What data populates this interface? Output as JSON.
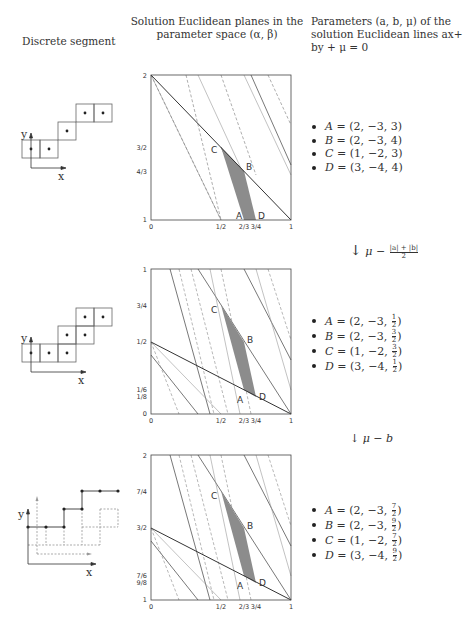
{
  "headers": {
    "col1": "Discrete segment",
    "col2_line1": "Solution Euclidean planes in the",
    "col2_line2": "parameter space (α, β)",
    "col3_line1": "Parameters (a, b, μ) of the",
    "col3_line2": "solution Euclidean lines ax+",
    "col3_line3": "by + μ = 0"
  },
  "rows": [
    {
      "segment": {
        "axis_x": "x",
        "axis_y": "y",
        "style": "pixels"
      },
      "params": [
        {
          "name": "A",
          "a": "2",
          "b": "−3",
          "mu": "3"
        },
        {
          "name": "B",
          "a": "2",
          "b": "−3",
          "mu": "4"
        },
        {
          "name": "C",
          "a": "1",
          "b": "−2",
          "mu": "3"
        },
        {
          "name": "D",
          "a": "3",
          "b": "−4",
          "mu": "4"
        }
      ],
      "transform": {
        "arrow": "↓",
        "text": "μ −",
        "frac_num": "|a| + |b|",
        "frac_den": "2"
      }
    },
    {
      "segment": {
        "axis_x": "x",
        "axis_y": "y",
        "style": "pixels"
      },
      "params": [
        {
          "name": "A",
          "a": "2",
          "b": "−3",
          "mu_num": "1",
          "mu_den": "2"
        },
        {
          "name": "B",
          "a": "2",
          "b": "−3",
          "mu_num": "3",
          "mu_den": "2"
        },
        {
          "name": "C",
          "a": "1",
          "b": "−2",
          "mu_num": "3",
          "mu_den": "2"
        },
        {
          "name": "D",
          "a": "3",
          "b": "−4",
          "mu_num": "1",
          "mu_den": "2"
        }
      ],
      "transform": {
        "arrow": "↓",
        "text": "μ − b"
      }
    },
    {
      "segment": {
        "axis_x": "x",
        "axis_y": "y",
        "style": "points"
      },
      "params": [
        {
          "name": "A",
          "a": "2",
          "b": "−3",
          "mu_num": "7",
          "mu_den": "2"
        },
        {
          "name": "B",
          "a": "2",
          "b": "−3",
          "mu_num": "9",
          "mu_den": "2"
        },
        {
          "name": "C",
          "a": "1",
          "b": "−2",
          "mu_num": "7",
          "mu_den": "2"
        },
        {
          "name": "D",
          "a": "3",
          "b": "−4",
          "mu_num": "9",
          "mu_den": "2"
        }
      ]
    }
  ],
  "plots": [
    {
      "xticks": [
        "0",
        "1/2",
        "2/3",
        "3/4",
        "1"
      ],
      "yticks": [
        {
          "label": "1",
          "v": 0
        },
        {
          "label": "4/3",
          "v": 0.3333
        },
        {
          "label": "3/2",
          "v": 0.5
        },
        {
          "label": "2",
          "v": 1
        }
      ],
      "points": {
        "A": "A",
        "B": "B",
        "C": "C",
        "D": "D"
      }
    },
    {
      "xticks": [
        "0",
        "1/2",
        "2/3",
        "3/4",
        "1"
      ],
      "yticks": [
        {
          "label": "0",
          "v": 0
        },
        {
          "label": "1/8",
          "v": 0.125
        },
        {
          "label": "1/6",
          "v": 0.1667
        },
        {
          "label": "1/2",
          "v": 0.5
        },
        {
          "label": "3/4",
          "v": 0.75
        },
        {
          "label": "1",
          "v": 1
        }
      ],
      "points": {
        "A": "A",
        "B": "B",
        "C": "C",
        "D": "D"
      }
    },
    {
      "xticks": [
        "0",
        "1/2",
        "2/3",
        "3/4",
        "1"
      ],
      "yticks": [
        {
          "label": "1",
          "v": 0
        },
        {
          "label": "9/8",
          "v": 0.125
        },
        {
          "label": "7/6",
          "v": 0.1667
        },
        {
          "label": "3/2",
          "v": 0.5
        },
        {
          "label": "7/4",
          "v": 0.75
        },
        {
          "label": "2",
          "v": 1
        }
      ],
      "points": {
        "A": "A",
        "B": "B",
        "C": "C",
        "D": "D"
      }
    }
  ],
  "colors": {
    "region": "#8c8c8c",
    "line": "#444444",
    "dashed": "#777777",
    "thin": "#999999"
  }
}
